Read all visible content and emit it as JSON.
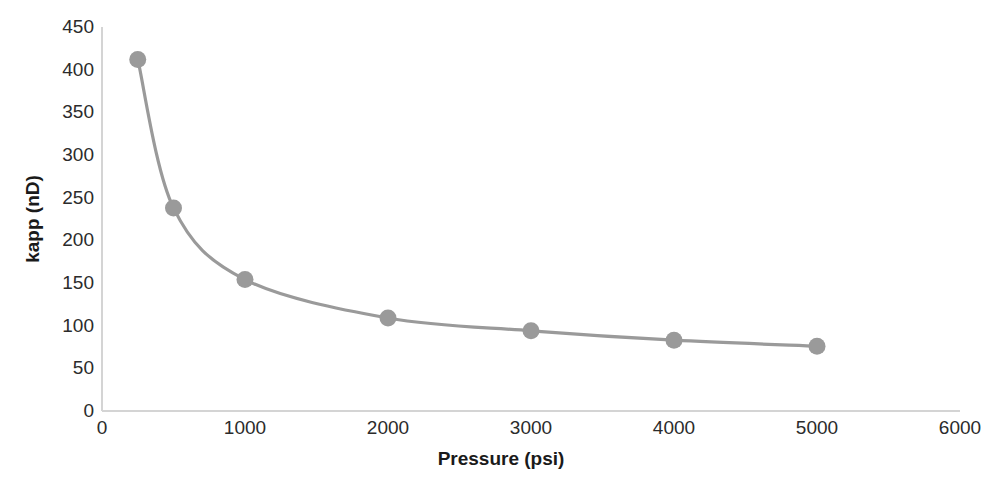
{
  "chart_data": {
    "type": "line",
    "title": "",
    "xlabel": "Pressure (psi)",
    "ylabel": "kapp (nD)",
    "x": [
      250,
      500,
      1000,
      2000,
      3000,
      4000,
      5000
    ],
    "values": [
      412,
      238,
      154,
      109,
      94,
      83,
      76
    ],
    "series": [
      {
        "name": "kapp",
        "x": [
          250,
          500,
          1000,
          2000,
          3000,
          4000,
          5000
        ],
        "values": [
          412,
          238,
          154,
          109,
          94,
          83,
          76
        ]
      }
    ],
    "xlim": [
      0,
      6000
    ],
    "ylim": [
      0,
      450
    ],
    "xticks": [
      "0",
      "1000",
      "2000",
      "3000",
      "4000",
      "5000",
      "6000"
    ],
    "xtick_values": [
      0,
      1000,
      2000,
      3000,
      4000,
      5000,
      6000
    ],
    "yticks": [
      "0",
      "50",
      "100",
      "150",
      "200",
      "250",
      "300",
      "350",
      "400",
      "450"
    ],
    "ytick_values": [
      0,
      50,
      100,
      150,
      200,
      250,
      300,
      350,
      400,
      450
    ],
    "grid": false,
    "legend": false,
    "legend_position": "none",
    "marker": "circle",
    "marker_color": "#9a9a9a",
    "line_color": "#9a9a9a",
    "axis_color": "#d4d4d4",
    "text_color": "#2b2b2b",
    "background_color": "#ffffff"
  }
}
